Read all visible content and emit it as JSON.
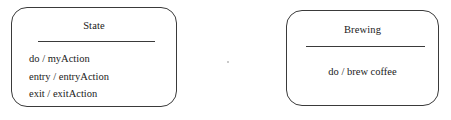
{
  "diagram": {
    "type": "uml-state-diagram",
    "background_color": "#ffffff",
    "stroke_color": "#3a3a3a",
    "text_color": "#1a1a1a",
    "states": [
      {
        "id": "state-generic",
        "name": "State",
        "actions": [
          "do / myAction",
          "entry / entryAction",
          "exit / exitAction"
        ]
      },
      {
        "id": "state-brewing",
        "name": "Brewing",
        "actions": [
          "do / brew coffee"
        ]
      }
    ]
  }
}
